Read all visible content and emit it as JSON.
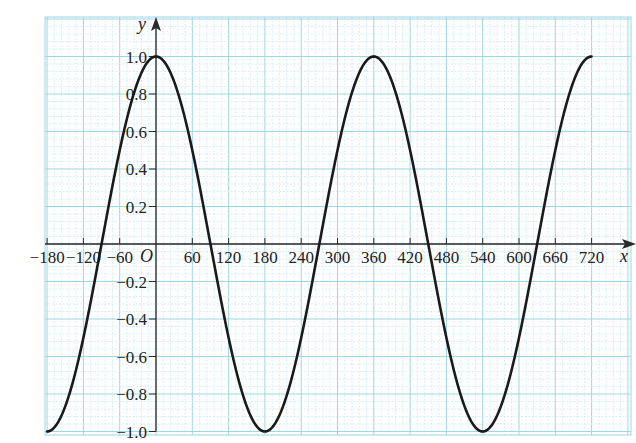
{
  "chart_data": {
    "type": "line",
    "title": "",
    "xlabel": "x",
    "ylabel": "y",
    "origin_label": "O",
    "function": "y = cos x",
    "xlim": [
      -180,
      720
    ],
    "ylim": [
      -1.0,
      1.0
    ],
    "grid": true,
    "x_ticks": [
      -180,
      -120,
      -60,
      60,
      120,
      180,
      240,
      300,
      360,
      420,
      480,
      540,
      600,
      660,
      720
    ],
    "x_tick_labels": [
      "−180",
      "−120",
      "−60",
      "60",
      "120",
      "180",
      "240",
      "300",
      "360",
      "420",
      "480",
      "540",
      "600",
      "660",
      "720"
    ],
    "y_ticks": [
      1.0,
      0.8,
      0.6,
      0.4,
      0.2,
      -0.2,
      -0.4,
      -0.6,
      -0.8,
      -1.0
    ],
    "y_tick_labels": [
      "1.0",
      "0.8",
      "0.6",
      "0.4",
      "0.2",
      "−0.2",
      "−0.4",
      "−0.6",
      "−0.8",
      "−1.0"
    ],
    "series": [
      {
        "name": "cos x",
        "x": [
          -180,
          -150,
          -120,
          -90,
          -60,
          -30,
          0,
          30,
          60,
          90,
          120,
          150,
          180,
          210,
          240,
          270,
          300,
          330,
          360,
          390,
          420,
          450,
          480,
          510,
          540,
          570,
          600,
          630,
          660,
          690,
          720
        ],
        "values": [
          -1.0,
          -0.87,
          -0.5,
          0.0,
          0.5,
          0.87,
          1.0,
          0.87,
          0.5,
          0.0,
          -0.5,
          -0.87,
          -1.0,
          -0.87,
          -0.5,
          0.0,
          0.5,
          0.87,
          1.0,
          0.87,
          0.5,
          0.0,
          -0.5,
          -0.87,
          -1.0,
          -0.87,
          -0.5,
          0.0,
          0.5,
          0.87,
          1.0
        ]
      }
    ],
    "colors": {
      "curve": "#1a1a1a",
      "axes": "#2a2a2a",
      "grid_major": "#9fd6e4",
      "grid_minor": "#cdebf2"
    }
  }
}
